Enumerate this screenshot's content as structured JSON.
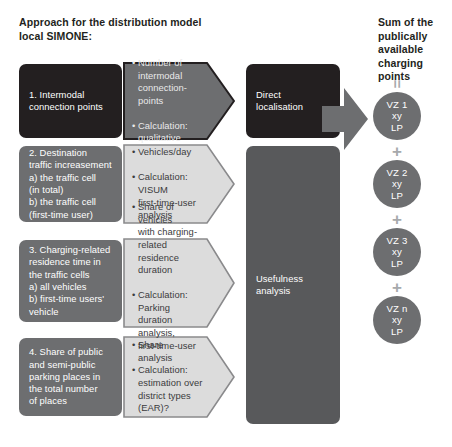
{
  "headings": {
    "left": "Approach for the distribution model\nlocal SIMONE:",
    "right": "Sum of the\npublically available\ncharging points"
  },
  "colors": {
    "black": "#231f20",
    "dark_gray": "#58595b",
    "mid_gray": "#6d6e70",
    "light_gray": "#d9d9d9",
    "operator_gray": "#a7a9ac",
    "text_white": "#ffffff"
  },
  "criteria": [
    {
      "id": "intermodal-connection-points",
      "label": "1. Intermodal\nconnection points",
      "style": "black"
    },
    {
      "id": "destination-traffic-increasement",
      "label": "2. Destination\ntraffic increasement\na) the traffic cell\n    (in total)\nb) the traffic cell\n    (first-time user)",
      "style": "mid-gray"
    },
    {
      "id": "charging-related-residence-time",
      "label": "3. Charging-related\n    residence time in\nthe traffic cells\na) all vehicles\nb) first-time users'\nvehicle",
      "style": "mid-gray"
    },
    {
      "id": "share-of-public-parking-places",
      "label": "4. Share of public\nand semi-public\nparking places in\nthe total number\nof places",
      "style": "mid-gray"
    }
  ],
  "callouts": [
    {
      "id": "callout-intermodal",
      "style": "dark",
      "bullets": [
        "• Number of\n  intermodal\n  connection-points",
        "• Calculation:\n  qualitative"
      ]
    },
    {
      "id": "callout-vehicles-per-day",
      "style": "light",
      "bullets": [
        "• Vehicles/day",
        "• Calculation:\n  VISUM\n  first-time-user\n  analysis"
      ]
    },
    {
      "id": "callout-share-of-vehicles",
      "style": "light",
      "bullets": [
        "• Share of vehicles\n  with charging-\n  related residence\n  duration",
        "• Calculation: Parking\n  duration analysis,\n  first-time-user\n  analysis"
      ]
    },
    {
      "id": "callout-share",
      "style": "light",
      "bullets": [
        "• Share",
        "• Calculation:\n  estimation over\n  district types\n  (EAR)?"
      ]
    }
  ],
  "outcomes": [
    {
      "id": "direct-localisation",
      "label": "Direct\nlocalisation",
      "style": "black"
    },
    {
      "id": "usefulness-analysis",
      "label": "Usefulness\nanalysis",
      "style": "dark-gray"
    }
  ],
  "sum_column": {
    "equals_symbol": "=",
    "plus_symbol": "+",
    "nodes": [
      {
        "id": "vz-1",
        "label": "VZ 1\nxy\nLP"
      },
      {
        "id": "vz-2",
        "label": "VZ 2\nxy\nLP"
      },
      {
        "id": "vz-3",
        "label": "VZ 3\nxy\nLP"
      },
      {
        "id": "vz-n",
        "label": "VZ n\nxy\nLP"
      }
    ]
  }
}
